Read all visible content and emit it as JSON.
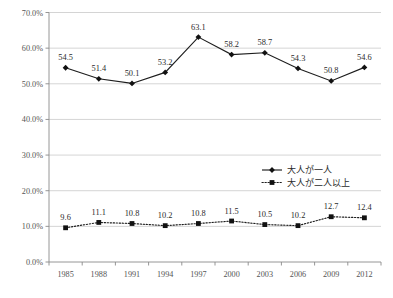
{
  "chart_data": {
    "type": "line",
    "title": "",
    "subtitle": "",
    "xlabel": "",
    "ylabel": "",
    "categories": [
      "1985",
      "1988",
      "1991",
      "1994",
      "1997",
      "2000",
      "2003",
      "2006",
      "2009",
      "2012"
    ],
    "series": [
      {
        "name": "大人が一人",
        "marker": "diamond",
        "line_style": "solid",
        "color": "#1d1d1d",
        "values": [
          54.5,
          51.4,
          50.1,
          53.2,
          63.1,
          58.2,
          58.7,
          54.3,
          50.8,
          54.6
        ],
        "labels": [
          "54.5",
          "51.4",
          "50.1",
          "53.2",
          "63.1",
          "58.2",
          "58.7",
          "54.3",
          "50.8",
          "54.6"
        ]
      },
      {
        "name": "大人が二人以上",
        "marker": "square",
        "line_style": "dotted",
        "color": "#1d1d1d",
        "values": [
          9.6,
          11.1,
          10.8,
          10.2,
          10.8,
          11.5,
          10.5,
          10.2,
          12.7,
          12.4
        ],
        "labels": [
          "9.6",
          "11.1",
          "10.8",
          "10.2",
          "10.8",
          "11.5",
          "10.5",
          "10.2",
          "12.7",
          "12.4"
        ]
      }
    ],
    "ylim": [
      0,
      70
    ],
    "ytick_values": [
      0,
      10,
      20,
      30,
      40,
      50,
      60,
      70
    ],
    "ytick_labels": [
      "0.0%",
      "10.0%",
      "20.0%",
      "30.0%",
      "40.0%",
      "50.0%",
      "60.0%",
      "70.0%"
    ],
    "grid": true,
    "grid_axis": "y",
    "legend_position": "middle-right",
    "legend": [
      {
        "label": "大人が一人",
        "marker": "diamond",
        "line_style": "solid"
      },
      {
        "label": "大人が二人以上",
        "marker": "square",
        "line_style": "dotted"
      }
    ],
    "colors": {
      "gridline": "#c9c9c9",
      "axis": "#8a8a8a",
      "series_1": "#1d1d1d",
      "series_2": "#1d1d1d",
      "label_text": "#2b2b2b",
      "tick_text": "#555555",
      "background": "#ffffff"
    }
  }
}
